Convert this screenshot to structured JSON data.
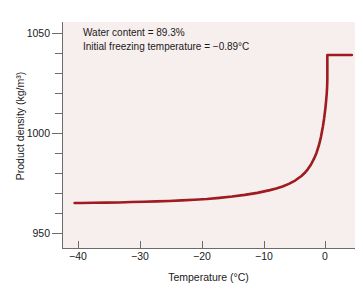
{
  "chart_data": {
    "type": "line",
    "title": "",
    "xlabel": "Temperature (°C)",
    "ylabel": "Product density (kg/m³)",
    "xlim": [
      -43,
      3.5
    ],
    "ylim": [
      935,
      1058
    ],
    "grid": false,
    "legend": null,
    "line_color": "#9e1b20",
    "plot_background": "#f7eeee",
    "page_background": "#ffffff",
    "xticks": [
      -40,
      -30,
      -20,
      -10,
      0
    ],
    "xtick_labels": [
      "−40",
      "−30",
      "−20",
      "−10",
      "0"
    ],
    "yticks": [
      950,
      1000,
      1050
    ],
    "ytick_labels": [
      "950",
      "1000",
      "1050"
    ],
    "yticks_minor": [
      960,
      970,
      980,
      990,
      1010,
      1020,
      1030,
      1040
    ],
    "series": [
      {
        "name": "Product density",
        "x": [
          -41.0,
          -40.0,
          -38.0,
          -36.0,
          -34.0,
          -32.0,
          -30.0,
          -28.0,
          -26.0,
          -24.0,
          -22.0,
          -20.0,
          -18.0,
          -16.0,
          -14.0,
          -12.0,
          -10.0,
          -9.0,
          -8.0,
          -7.0,
          -6.0,
          -5.0,
          -4.5,
          -4.0,
          -3.5,
          -3.0,
          -2.6,
          -2.2,
          -1.9,
          -1.6,
          -1.4,
          -1.2,
          -1.1,
          -1.0,
          -0.95,
          -0.91,
          -0.89,
          -0.89,
          -0.5,
          0.0,
          1.0,
          2.0,
          3.0
        ],
        "y": [
          959.5,
          959.5,
          959.6,
          959.7,
          959.8,
          960.0,
          960.2,
          960.4,
          960.6,
          960.9,
          961.3,
          961.7,
          962.3,
          963.0,
          963.9,
          965.0,
          966.5,
          967.4,
          968.5,
          969.9,
          971.7,
          974.2,
          975.8,
          977.8,
          980.3,
          983.6,
          986.9,
          991.2,
          995.5,
          1001.0,
          1005.5,
          1011.0,
          1014.5,
          1018.5,
          1021.0,
          1024.0,
          1027.0,
          1040.0,
          1040.0,
          1040.0,
          1040.0,
          1040.0,
          1040.0
        ]
      }
    ],
    "annotations": [
      {
        "text": "Water content = 89.3%"
      },
      {
        "text": "Initial freezing temperature = −0.89°C"
      }
    ]
  },
  "axes": {
    "x_title": "Temperature (°C)",
    "y_title": "Product density (kg/m³)"
  },
  "annotation": {
    "line1": "Water content = 89.3%",
    "line2": "Initial freezing temperature = −0.89°C"
  },
  "y_labels": {
    "t1050": "1050",
    "t1000": "1000",
    "t950": "950"
  },
  "x_labels": {
    "n40": "−40",
    "n30": "−30",
    "n20": "−20",
    "n10": "−10",
    "z0": "0"
  }
}
